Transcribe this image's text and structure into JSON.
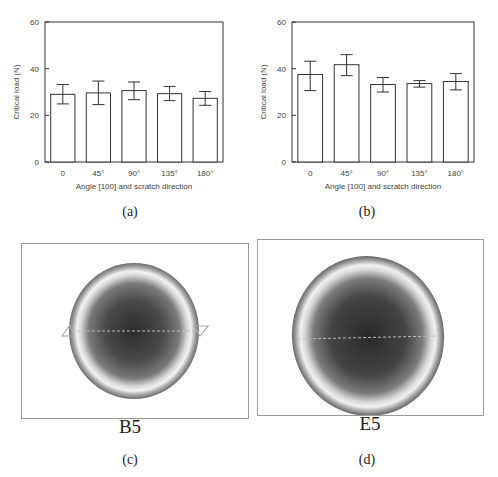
{
  "figure": {
    "captions": {
      "a": "(a)",
      "b": "(b)",
      "c": "(c)",
      "d": "(d)"
    },
    "images": [
      {
        "panel": "c",
        "label": "B5"
      },
      {
        "panel": "d",
        "label": "E5"
      }
    ]
  },
  "chart_data": [
    {
      "panel": "a",
      "type": "bar",
      "title": "",
      "xlabel": "Angle [100] and scratch direction",
      "ylabel": "Critical load (N)",
      "categories": [
        "0",
        "45°",
        "90°",
        "135°",
        "180°"
      ],
      "values": [
        29.0,
        29.6,
        30.6,
        29.3,
        27.3
      ],
      "error_upper": [
        33.2,
        34.7,
        34.3,
        32.4,
        30.2
      ],
      "error_lower": [
        24.9,
        24.6,
        26.7,
        26.3,
        24.3
      ],
      "ylim": [
        0,
        60
      ],
      "yticks": [
        0,
        20,
        40,
        60
      ],
      "grid": false,
      "legend": null
    },
    {
      "panel": "b",
      "type": "bar",
      "title": "",
      "xlabel": "Angle [100] and scratch direction",
      "ylabel": "Critical load (N)",
      "categories": [
        "0",
        "45°",
        "90°",
        "135°",
        "180°"
      ],
      "values": [
        37.5,
        41.7,
        33.2,
        33.6,
        34.5
      ],
      "error_upper": [
        43.2,
        46.0,
        36.2,
        34.9,
        37.9
      ],
      "error_lower": [
        30.6,
        37.0,
        30.0,
        32.1,
        30.9
      ],
      "ylim": [
        0,
        60
      ],
      "yticks": [
        0,
        20,
        40,
        60
      ],
      "grid": false,
      "legend": null
    }
  ]
}
